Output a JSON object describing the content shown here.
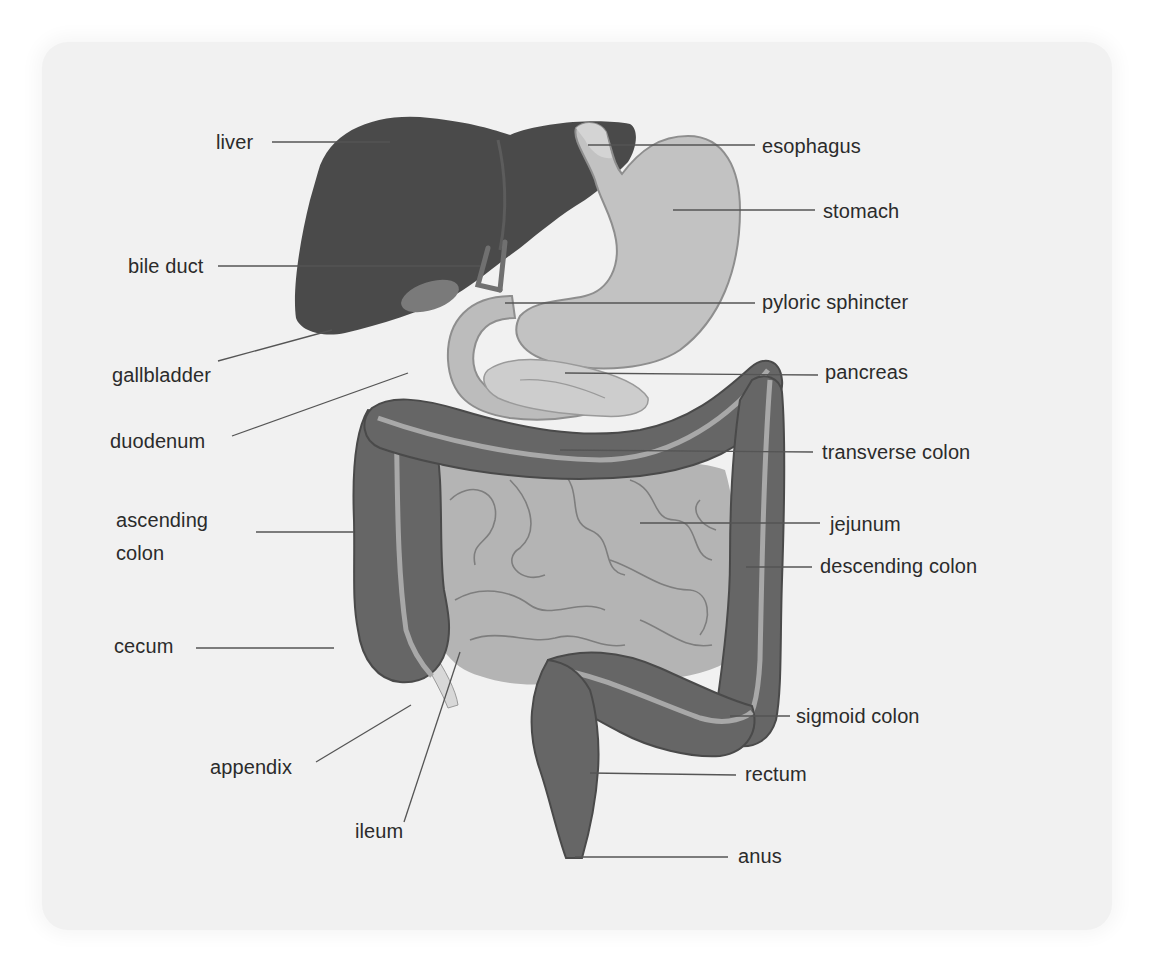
{
  "diagram": {
    "colors": {
      "panel_background": "#f1f1f1",
      "liver": "#4a4a4a",
      "colon": "#666666",
      "colon_stripe": "#a8a8a8",
      "small_intestine": "#b4b4b4",
      "stomach": "#c2c2c2",
      "pancreas": "#cdcdcd",
      "gallbladder": "#7a7a7a",
      "appendix": "#d8d8d8",
      "leader_line": "#555555",
      "label_text": "#2b2b2b"
    },
    "labels": {
      "liver": "liver",
      "esophagus": "esophagus",
      "stomach": "stomach",
      "bile_duct": "bile duct",
      "pyloric_sphincter": "pyloric sphincter",
      "gallbladder": "gallbladder",
      "pancreas": "pancreas",
      "duodenum": "duodenum",
      "transverse_colon": "transverse colon",
      "ascending_colon": "ascending\ncolon",
      "jejunum": "jejunum",
      "descending_colon": "descending colon",
      "cecum": "cecum",
      "sigmoid_colon": "sigmoid colon",
      "appendix": "appendix",
      "rectum": "rectum",
      "ileum": "ileum",
      "anus": "anus"
    },
    "left_labels": [
      "liver",
      "bile duct",
      "gallbladder",
      "duodenum",
      "ascending colon",
      "cecum",
      "appendix",
      "ileum"
    ],
    "right_labels": [
      "esophagus",
      "stomach",
      "pyloric sphincter",
      "pancreas",
      "transverse colon",
      "jejunum",
      "descending colon",
      "sigmoid colon",
      "rectum",
      "anus"
    ]
  }
}
